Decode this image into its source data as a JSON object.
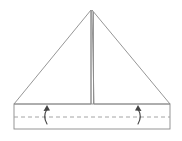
{
  "diagram": {
    "fold_line_type": "valley-fold",
    "arrow_count": 2,
    "arrow_direction": "up",
    "colors": {
      "outline": "#8a8a8a",
      "fold_line": "#9a9a9a",
      "arrow": "#444444",
      "background": "#ffffff"
    }
  }
}
